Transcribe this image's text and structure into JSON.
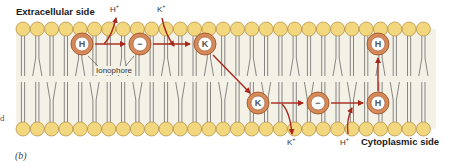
{
  "figure": {
    "panel_label": "(b)",
    "left_edge_fragment": "d"
  },
  "labels": {
    "extracellular_side": "Extracellular side",
    "cytoplasmic_side": "Cytoplasmic side",
    "ionophore": "Ionophore"
  },
  "ions": {
    "h_top": {
      "base": "H",
      "charge": "+"
    },
    "k_top": {
      "base": "K",
      "charge": "+"
    },
    "k_bottom": {
      "base": "K",
      "charge": "+"
    },
    "h_bottom": {
      "base": "H",
      "charge": "+"
    }
  },
  "ionophores": [
    {
      "id": "ionophore-h-outer",
      "symbol": "H",
      "cx": 82,
      "cy": 44
    },
    {
      "id": "ionophore-empty-outer",
      "symbol": "−",
      "cx": 140,
      "cy": 44
    },
    {
      "id": "ionophore-k-outer",
      "symbol": "K",
      "cx": 205,
      "cy": 44
    },
    {
      "id": "ionophore-k-inner",
      "symbol": "K",
      "cx": 258,
      "cy": 103
    },
    {
      "id": "ionophore-empty-inner",
      "symbol": "−",
      "cx": 318,
      "cy": 103
    },
    {
      "id": "ionophore-h-inner",
      "symbol": "H",
      "cx": 378,
      "cy": 103
    },
    {
      "id": "ionophore-h-rising",
      "symbol": "H",
      "cx": 378,
      "cy": 44
    }
  ],
  "colors": {
    "lipid_head_fill": "#f3d77f",
    "lipid_head_stroke": "#b08a3a",
    "membrane_bg": "#f4f1e6",
    "tail_stroke": "#6a6a6a",
    "ionophore_ring": "#d58a5a",
    "ionophore_ring_stroke": "#9a4a22",
    "arrow": "#a8281c"
  }
}
